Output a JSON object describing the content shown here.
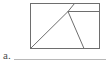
{
  "figure": {
    "kind": "geometry-diagram",
    "background_color": "#ffffff",
    "stroke_color": "#6e6e6e",
    "stroke_color_light": "#9a9a9a",
    "stroke_width": 1,
    "canvas": {
      "width": 106,
      "height": 63
    },
    "rectangle": {
      "name": "outer-rectangle",
      "left": 30.5,
      "top": 3.5,
      "right": 99.5,
      "bottom": 48.5,
      "width": 69,
      "height": 45
    },
    "points": {
      "top_left": {
        "x": 30.5,
        "y": 3.5
      },
      "top_right": {
        "x": 99.5,
        "y": 3.5
      },
      "bottom_left": {
        "x": 30.5,
        "y": 48.5
      },
      "bottom_right": {
        "x": 99.5,
        "y": 48.5
      },
      "apex": {
        "x": 68.0,
        "y": 11.5
      },
      "top_edge_hit": {
        "x": 74.5,
        "y": 3.5
      },
      "right_edge_hit": {
        "x": 99.5,
        "y": 11.5
      },
      "bottom_edge_hit": {
        "x": 84.0,
        "y": 48.5
      }
    },
    "segments": [
      {
        "name": "apex-to-right-edge-horizontal",
        "x1": 68.0,
        "y1": 11.5,
        "x2": 99.5,
        "y2": 11.5,
        "orientation": "horizontal"
      },
      {
        "name": "apex-to-top-edge",
        "x1": 68.0,
        "y1": 11.5,
        "x2": 74.5,
        "y2": 3.5,
        "orientation": "diagonal-up-right"
      },
      {
        "name": "apex-to-bottom-left-corner",
        "x1": 68.0,
        "y1": 11.5,
        "x2": 30.5,
        "y2": 48.5,
        "orientation": "diagonal-down-left"
      },
      {
        "name": "apex-to-bottom-edge",
        "x1": 68.0,
        "y1": 11.5,
        "x2": 84.0,
        "y2": 48.5,
        "orientation": "diagonal-down-right"
      }
    ],
    "baseline_rule": {
      "name": "caption-underline",
      "x1": 14.0,
      "y1": 59.5,
      "x2": 106.0,
      "y2": 59.5,
      "color": "#b8b8b8"
    }
  },
  "caption": {
    "label": "a."
  }
}
